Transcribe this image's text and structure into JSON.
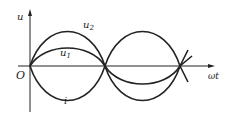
{
  "diagram": {
    "axes": {
      "y_label": "u",
      "x_label": "ωt",
      "origin_label": "O"
    },
    "curves": [
      {
        "name": "u2",
        "label": "u",
        "subscript": "2",
        "amplitude": 45,
        "phase": "in phase with u1"
      },
      {
        "name": "u1",
        "label": "u",
        "subscript": "1",
        "amplitude": 24,
        "phase": "in phase with u2"
      },
      {
        "name": "i",
        "label": "i",
        "subscript": "",
        "amplitude": -44,
        "phase": "opposite to voltages"
      }
    ],
    "colors": {
      "line": "#222222",
      "background": "#ffffff"
    }
  }
}
